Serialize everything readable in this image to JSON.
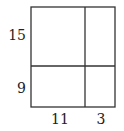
{
  "diagram": {
    "type": "area-model-rectangle",
    "row_labels": [
      "15",
      "9"
    ],
    "column_labels": [
      "11",
      "3"
    ],
    "line_color": "#333333"
  }
}
